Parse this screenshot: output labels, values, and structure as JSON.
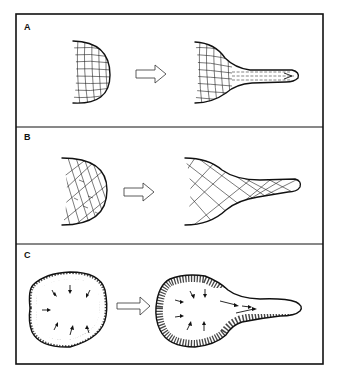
{
  "figure": {
    "panels": [
      {
        "label": "A",
        "before_shape": "half-dome mesh (rectangular grid)",
        "transition": "arrow-right",
        "after_shape": "mesh with elongated tube, dashed internal flow lines"
      },
      {
        "label": "B",
        "before_shape": "half-dome mesh (irregular fibrous network)",
        "transition": "arrow-right",
        "after_shape": "mesh with elongated tube, diagonal network"
      },
      {
        "label": "C",
        "before_shape": "round cell with peripheral mesh and inward arrows",
        "transition": "arrow-right",
        "after_shape": "round cell with protrusion, peripheral mesh and flow arrows into protrusion"
      }
    ],
    "colors": {
      "ink": "#111111",
      "background": "#ffffff"
    }
  }
}
